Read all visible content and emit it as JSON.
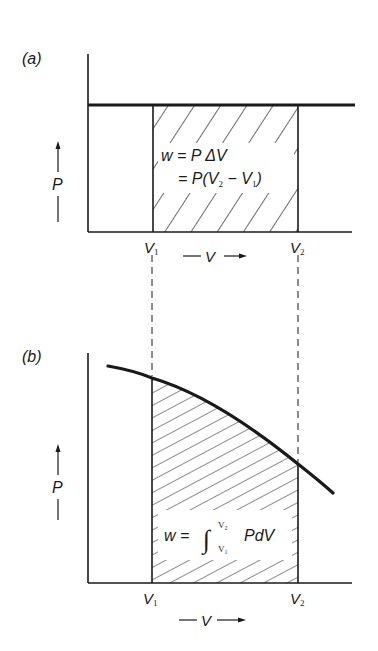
{
  "panels": [
    {
      "id": "a",
      "label": "(a)",
      "y_axis_label": "P",
      "x_axis_label": "V",
      "x_markers": [
        {
          "name": "V",
          "sub": "1"
        },
        {
          "name": "V",
          "sub": "2"
        }
      ],
      "process": "constant pressure",
      "equation": {
        "line1": "w = P ΔV",
        "line2_prefix": "= P(V",
        "line2_sub1": "2",
        "line2_mid": " − V",
        "line2_sub2": "1",
        "line2_suffix": ")"
      }
    },
    {
      "id": "b",
      "label": "(b)",
      "y_axis_label": "P",
      "x_axis_label": "V",
      "x_markers": [
        {
          "name": "V",
          "sub": "1"
        },
        {
          "name": "V",
          "sub": "2"
        }
      ],
      "process": "variable pressure",
      "equation": {
        "lhs": "w = ",
        "integral": "∫",
        "upper": "V₂",
        "lower": "V₁",
        "rhs": "PdV"
      }
    }
  ],
  "colors": {
    "ink": "#1a1a1a",
    "background": "#ffffff"
  }
}
